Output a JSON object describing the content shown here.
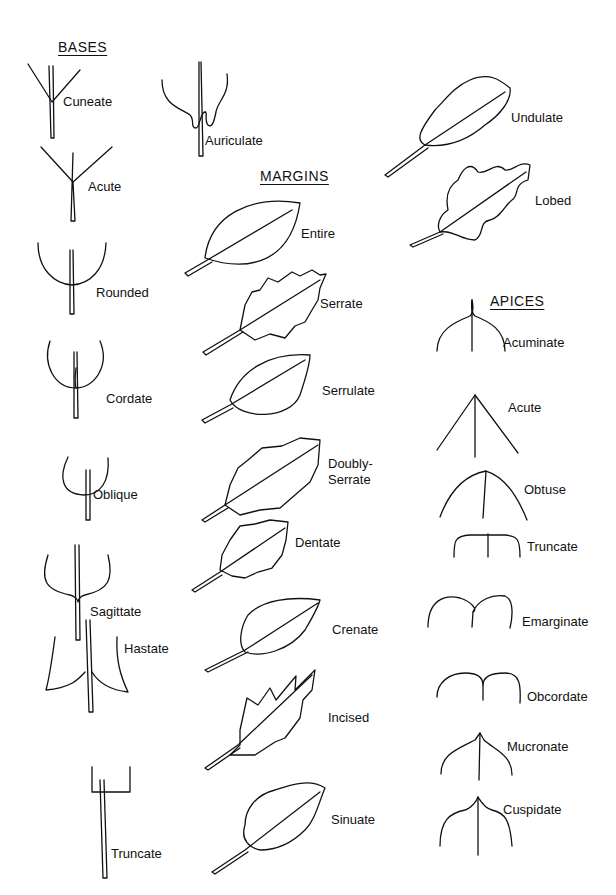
{
  "sections": {
    "bases": {
      "title": "BASES",
      "items": [
        "Cuneate",
        "Auriculate",
        "Acute",
        "Rounded",
        "Cordate",
        "Oblique",
        "Sagittate",
        "Hastate",
        "Truncate"
      ]
    },
    "margins": {
      "title": "MARGINS",
      "items": [
        "Entire",
        "Serrate",
        "Serrulate",
        "Doubly-\nSerrate",
        "Dentate",
        "Crenate",
        "Incised",
        "Sinuate",
        "Undulate",
        "Lobed"
      ]
    },
    "apices": {
      "title": "APICES",
      "items": [
        "Acuminate",
        "Acute",
        "Obtuse",
        "Truncate",
        "Emarginate",
        "Obcordate",
        "Mucronate",
        "Cuspidate"
      ]
    }
  }
}
